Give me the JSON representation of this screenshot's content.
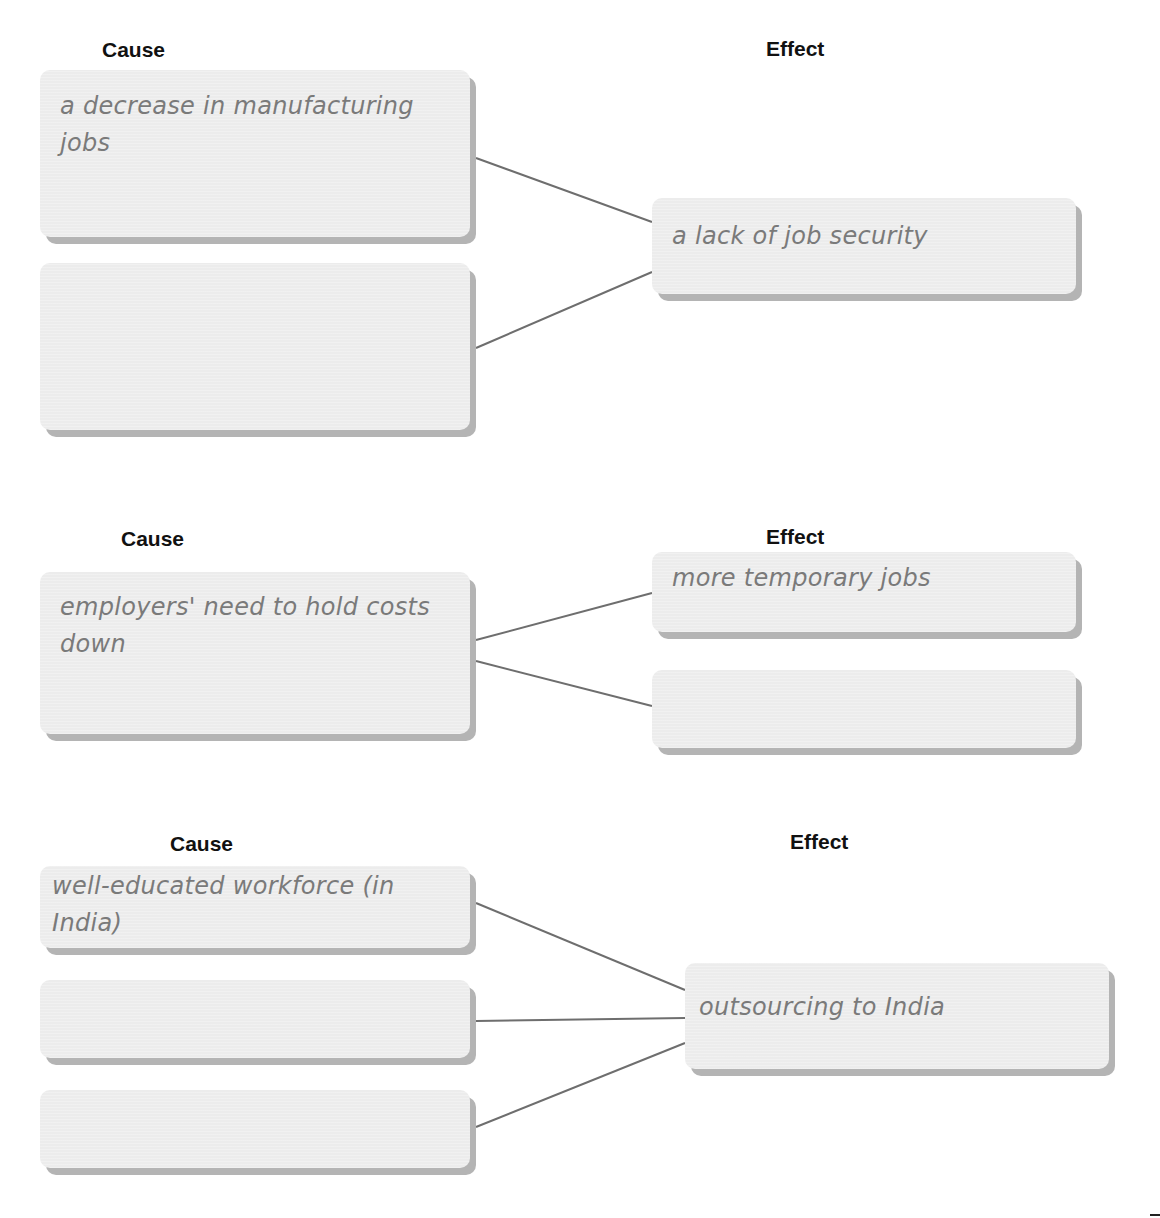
{
  "section1": {
    "cause_label": "Cause",
    "effect_label": "Effect",
    "causes": [
      {
        "text": "a decrease in manufacturing jobs"
      },
      {
        "text": ""
      }
    ],
    "effects": [
      {
        "text": "a lack of job security"
      }
    ]
  },
  "section2": {
    "cause_label": "Cause",
    "effect_label": "Effect",
    "causes": [
      {
        "text": "employers' need to hold costs down"
      }
    ],
    "effects": [
      {
        "text": "more temporary jobs"
      },
      {
        "text": ""
      }
    ]
  },
  "section3": {
    "cause_label": "Cause",
    "effect_label": "Effect",
    "causes": [
      {
        "text": "well-educated workforce (in India)"
      },
      {
        "text": ""
      },
      {
        "text": ""
      }
    ],
    "effects": [
      {
        "text": "outsourcing to India"
      }
    ]
  },
  "colors": {
    "box_fill": "#ececec",
    "box_shadow": "#b4b4b4",
    "connector": "#6e6e6e",
    "handwriting": "#7a7a7a",
    "heading": "#111111"
  }
}
